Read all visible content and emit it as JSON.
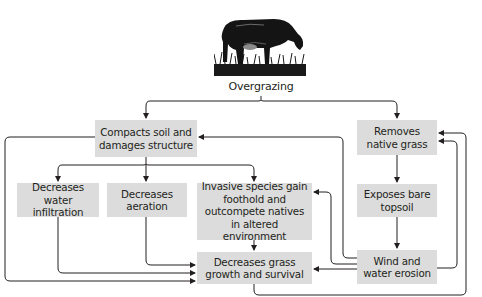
{
  "diagram": {
    "title": "Overgrazing",
    "illustration": "cow-grazing-icon",
    "nodes": [
      {
        "id": "compacts",
        "label": "Compacts soil and damages structure"
      },
      {
        "id": "removes",
        "label": "Removes native grass"
      },
      {
        "id": "infiltration",
        "label": "Decreases water infiltration"
      },
      {
        "id": "aeration",
        "label": "Decreases aeration"
      },
      {
        "id": "invasive",
        "label": "Invasive species gain foothold and outcompete natives in altered environment"
      },
      {
        "id": "exposes",
        "label": "Exposes bare topsoil"
      },
      {
        "id": "growth",
        "label": "Decreases grass growth and survival"
      },
      {
        "id": "erosion",
        "label": "Wind and water erosion"
      }
    ],
    "edges": [
      {
        "from": "overgrazing",
        "to": "compacts"
      },
      {
        "from": "overgrazing",
        "to": "removes"
      },
      {
        "from": "compacts",
        "to": "infiltration"
      },
      {
        "from": "compacts",
        "to": "aeration"
      },
      {
        "from": "compacts",
        "to": "invasive"
      },
      {
        "from": "compacts",
        "to": "growth"
      },
      {
        "from": "infiltration",
        "to": "growth"
      },
      {
        "from": "aeration",
        "to": "growth"
      },
      {
        "from": "invasive",
        "to": "growth"
      },
      {
        "from": "removes",
        "to": "exposes"
      },
      {
        "from": "exposes",
        "to": "erosion"
      },
      {
        "from": "erosion",
        "to": "growth"
      },
      {
        "from": "erosion",
        "to": "invasive"
      },
      {
        "from": "erosion",
        "to": "compacts"
      },
      {
        "from": "erosion",
        "to": "removes"
      },
      {
        "from": "growth",
        "to": "removes"
      }
    ],
    "colors": {
      "box_fill": "#dcdcdc",
      "line": "#231f20",
      "background": "#ffffff"
    }
  }
}
